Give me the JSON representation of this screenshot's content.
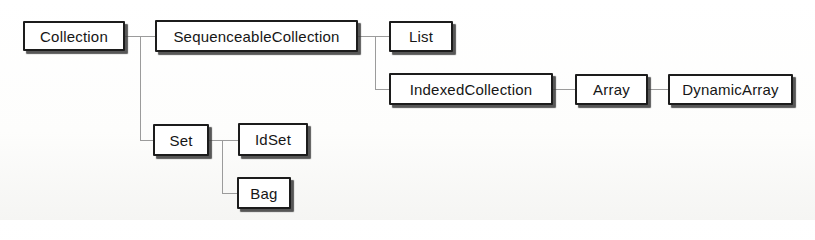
{
  "diagram": {
    "nodes": [
      {
        "id": "collection",
        "label": "Collection",
        "parent": null
      },
      {
        "id": "sequenceable-collection",
        "label": "SequenceableCollection",
        "parent": "Collection"
      },
      {
        "id": "list",
        "label": "List",
        "parent": "SequenceableCollection"
      },
      {
        "id": "indexed-collection",
        "label": "IndexedCollection",
        "parent": "SequenceableCollection"
      },
      {
        "id": "array",
        "label": "Array",
        "parent": "IndexedCollection"
      },
      {
        "id": "dynamic-array",
        "label": "DynamicArray",
        "parent": "Array"
      },
      {
        "id": "set",
        "label": "Set",
        "parent": "Collection"
      },
      {
        "id": "id-set",
        "label": "IdSet",
        "parent": "Set"
      },
      {
        "id": "bag",
        "label": "Bag",
        "parent": "Set"
      }
    ],
    "edges": [
      {
        "from": "Collection",
        "to": "SequenceableCollection"
      },
      {
        "from": "Collection",
        "to": "Set"
      },
      {
        "from": "SequenceableCollection",
        "to": "List"
      },
      {
        "from": "SequenceableCollection",
        "to": "IndexedCollection"
      },
      {
        "from": "IndexedCollection",
        "to": "Array"
      },
      {
        "from": "Array",
        "to": "DynamicArray"
      },
      {
        "from": "Set",
        "to": "IdSet"
      },
      {
        "from": "Set",
        "to": "Bag"
      }
    ],
    "colors": {
      "box_fill": "#ffffff",
      "box_border": "#1c1c1c",
      "box_shadow": "#3a3a3a",
      "connector": "#9b9b9b",
      "background": "#fdfdfc"
    }
  }
}
